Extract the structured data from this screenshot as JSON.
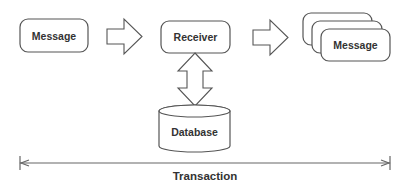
{
  "diagram": {
    "nodes": {
      "message_in": {
        "label": "Message"
      },
      "receiver": {
        "label": "Receiver"
      },
      "database": {
        "label": "Database"
      },
      "message_out": {
        "label": "Message",
        "stacked_count": 3
      }
    },
    "edges": [
      {
        "from": "message_in",
        "to": "receiver",
        "type": "block-arrow-right"
      },
      {
        "from": "receiver",
        "to": "message_out",
        "type": "block-arrow-right"
      },
      {
        "from": "receiver",
        "to": "database",
        "type": "block-arrow-bidirectional-vertical"
      }
    ],
    "span": {
      "label": "Transaction",
      "type": "double-headed-dimension-line"
    },
    "colors": {
      "stroke": "#555555",
      "text": "#333333",
      "fill": "#ffffff"
    }
  }
}
